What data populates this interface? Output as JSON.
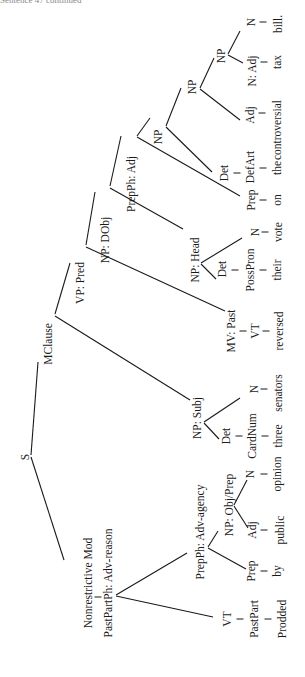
{
  "caption": "Sentence 47 continued",
  "orientation": "rotated 90° counter-clockwise; read bottom-to-top",
  "sentence": "Prodded by public opinion three senators reversed their vote on the controversial tax bill.",
  "nodes": {
    "s": "S",
    "mclause": "MClause",
    "vp_pred": "VP: Pred",
    "np_dobj": "NP: DObj",
    "prepph_adj": "PrepPh: Adj",
    "np_a": "NP",
    "np_b": "NP",
    "np_c": "NP",
    "np_head": "NP: Head",
    "np_subj": "NP: Subj",
    "mv_past": "MV: Past",
    "nonrestrictive_mod": "Nonrestrictive Mod",
    "pastpartph": "PastPartPh: Adv-reason",
    "prepph_agency": "PrepPh: Adv-agency",
    "np_objprep": "NP: Obj/Prep"
  },
  "leaves": [
    {
      "pos1": "N",
      "pos2": "",
      "word": "bill."
    },
    {
      "pos1": "",
      "pos2": "N: Adj",
      "word": "tax"
    },
    {
      "pos1": "Adj",
      "pos2": "",
      "word": "controversial"
    },
    {
      "pos1": "Det",
      "pos2": "DefArt",
      "word": "the"
    },
    {
      "pos1": "Prep",
      "pos2": "",
      "word": "on"
    },
    {
      "pos1": "N",
      "pos2": "",
      "word": "vote"
    },
    {
      "pos1": "Det",
      "pos2": "PossPron",
      "word": "their"
    },
    {
      "pos1": "MV: Past",
      "pos2": "VT",
      "word": "reversed"
    },
    {
      "pos1": "N",
      "pos2": "",
      "word": "senators"
    },
    {
      "pos1": "Det",
      "pos2": "CardNum",
      "word": "three"
    },
    {
      "pos1": "N",
      "pos2": "",
      "word": "opinion"
    },
    {
      "pos1": "Adj",
      "pos2": "",
      "word": "public"
    },
    {
      "pos1": "Prep",
      "pos2": "",
      "word": "by"
    },
    {
      "pos1": "VT",
      "pos2": "PastPart",
      "word": "Prodded"
    }
  ]
}
